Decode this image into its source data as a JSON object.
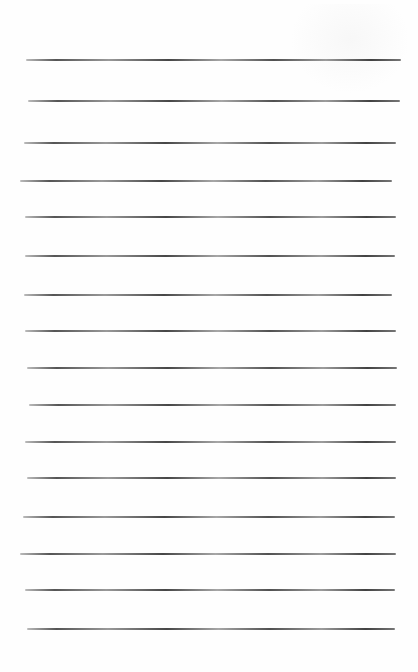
{
  "page": {
    "type": "blank ruled sheet",
    "background": "#fefefe",
    "rule_color": "#3c3c3c",
    "rules": [
      {
        "y": 60,
        "x1": 26,
        "x2": 401
      },
      {
        "y": 101,
        "x1": 28,
        "x2": 400
      },
      {
        "y": 143,
        "x1": 24,
        "x2": 396
      },
      {
        "y": 181,
        "x1": 20,
        "x2": 392
      },
      {
        "y": 217,
        "x1": 25,
        "x2": 396
      },
      {
        "y": 256,
        "x1": 25,
        "x2": 395
      },
      {
        "y": 295,
        "x1": 24,
        "x2": 392
      },
      {
        "y": 331,
        "x1": 25,
        "x2": 396
      },
      {
        "y": 368,
        "x1": 27,
        "x2": 397
      },
      {
        "y": 405,
        "x1": 29,
        "x2": 396
      },
      {
        "y": 442,
        "x1": 25,
        "x2": 396
      },
      {
        "y": 478,
        "x1": 27,
        "x2": 396
      },
      {
        "y": 517,
        "x1": 23,
        "x2": 395
      },
      {
        "y": 554,
        "x1": 20,
        "x2": 396
      },
      {
        "y": 590,
        "x1": 25,
        "x2": 395
      },
      {
        "y": 629,
        "x1": 27,
        "x2": 395
      }
    ]
  }
}
